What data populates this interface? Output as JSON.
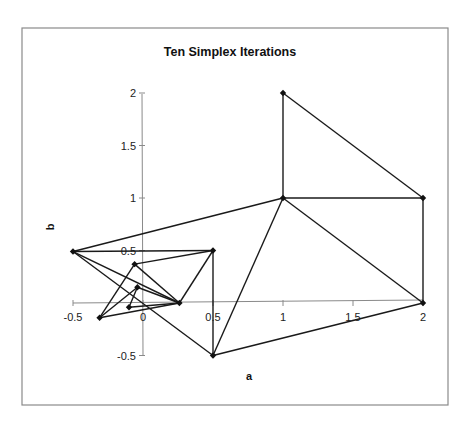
{
  "chart_data": {
    "type": "scatter",
    "title": "Ten Simplex Iterations",
    "xlabel": "a",
    "ylabel": "b",
    "xlim": [
      -0.5,
      2
    ],
    "ylim": [
      -0.5,
      2
    ],
    "x_ticks": [
      -0.5,
      0,
      0.5,
      1,
      1.5,
      2
    ],
    "x_tick_labels": [
      "-0.5",
      "0",
      "0.5",
      "1",
      "1.5",
      "2"
    ],
    "y_ticks": [
      -0.5,
      0.5,
      1,
      1.5,
      2
    ],
    "y_tick_labels": [
      "-0.5",
      "0.5",
      "1",
      "1.5",
      "2"
    ],
    "grid": false,
    "legend": null,
    "marker": "diamond",
    "points": [
      {
        "id": "p1",
        "a": 1,
        "b": 2
      },
      {
        "id": "p2",
        "a": 2,
        "b": 1
      },
      {
        "id": "p3",
        "a": 1,
        "b": 1
      },
      {
        "id": "p4",
        "a": 2,
        "b": 0
      },
      {
        "id": "p5",
        "a": 0.5,
        "b": -0.5
      },
      {
        "id": "p6",
        "a": -0.5,
        "b": 0.49
      },
      {
        "id": "p7",
        "a": 0.5,
        "b": 0.5
      },
      {
        "id": "p8",
        "a": 0.26,
        "b": 0
      },
      {
        "id": "p9",
        "a": -0.06,
        "b": 0.37
      },
      {
        "id": "p10",
        "a": -0.31,
        "b": -0.14
      },
      {
        "id": "p11",
        "a": -0.04,
        "b": 0.15
      },
      {
        "id": "p12",
        "a": -0.1,
        "b": -0.04
      }
    ],
    "edges": [
      [
        "p1",
        "p3"
      ],
      [
        "p1",
        "p2"
      ],
      [
        "p2",
        "p3"
      ],
      [
        "p2",
        "p4"
      ],
      [
        "p3",
        "p4"
      ],
      [
        "p3",
        "p5"
      ],
      [
        "p4",
        "p5"
      ],
      [
        "p3",
        "p6"
      ],
      [
        "p5",
        "p7"
      ],
      [
        "p5",
        "p6"
      ],
      [
        "p6",
        "p7"
      ],
      [
        "p6",
        "p8"
      ],
      [
        "p7",
        "p8"
      ],
      [
        "p7",
        "p9"
      ],
      [
        "p9",
        "p8"
      ],
      [
        "p9",
        "p10"
      ],
      [
        "p10",
        "p8"
      ],
      [
        "p10",
        "p11"
      ],
      [
        "p11",
        "p12"
      ],
      [
        "p12",
        "p8"
      ],
      [
        "p11",
        "p8"
      ]
    ],
    "triangles": [
      [
        "p1",
        "p2",
        "p3"
      ],
      [
        "p2",
        "p3",
        "p4"
      ],
      [
        "p3",
        "p4",
        "p5"
      ],
      [
        "p3",
        "p5",
        "p6"
      ],
      [
        "p5",
        "p6",
        "p7"
      ],
      [
        "p6",
        "p7",
        "p8"
      ],
      [
        "p7",
        "p8",
        "p9"
      ],
      [
        "p8",
        "p9",
        "p10"
      ],
      [
        "p8",
        "p10",
        "p11"
      ],
      [
        "p8",
        "p11",
        "p12"
      ]
    ]
  },
  "colors": {
    "line": "#1a1a1a",
    "marker": "#111111",
    "axis": "#8a8a8a",
    "frame": "#8a8a8a",
    "background": "#ffffff"
  }
}
